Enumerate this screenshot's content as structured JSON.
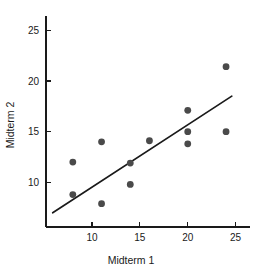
{
  "chart_data": {
    "type": "scatter",
    "title": "",
    "xlabel": "Midterm 1",
    "ylabel": "Midterm 2",
    "xlim": [
      5.2,
      26.5
    ],
    "ylim": [
      5.6,
      26.2
    ],
    "xticks": [
      10,
      15,
      20,
      25
    ],
    "xtick_labels": [
      "10",
      "15",
      "20",
      "25"
    ],
    "yticks": [
      10,
      15,
      20,
      25
    ],
    "ytick_labels": [
      "10",
      "15",
      "20",
      "25"
    ],
    "grid": false,
    "legend": false,
    "marker_color": "#4a4a4a",
    "line_color": "#1a1a1a",
    "points": [
      {
        "x": 8,
        "y": 12.0
      },
      {
        "x": 8,
        "y": 8.8
      },
      {
        "x": 11,
        "y": 14.0
      },
      {
        "x": 11,
        "y": 7.9
      },
      {
        "x": 14,
        "y": 11.9
      },
      {
        "x": 14,
        "y": 9.8
      },
      {
        "x": 16,
        "y": 14.1
      },
      {
        "x": 20,
        "y": 17.1
      },
      {
        "x": 20,
        "y": 15.0
      },
      {
        "x": 20,
        "y": 13.8
      },
      {
        "x": 24,
        "y": 21.4
      },
      {
        "x": 24,
        "y": 15.0
      }
    ],
    "fit_line": {
      "name": "regression-line",
      "x0": 5.9,
      "y0": 7.0,
      "x1": 24.6,
      "y1": 18.5
    }
  }
}
